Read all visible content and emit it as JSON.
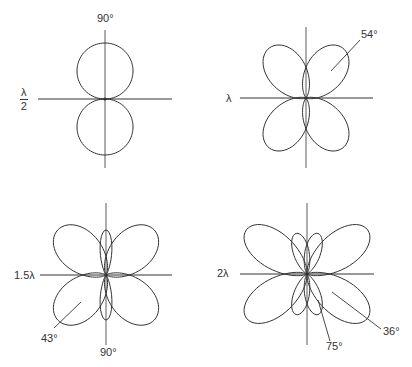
{
  "diagrams": [
    {
      "id": "half-wave",
      "length_label": "λ/2",
      "length_num": "λ",
      "length_den": "2",
      "center": [
        105,
        99
      ],
      "axis_h": [
        38,
        172
      ],
      "axis_v": [
        30,
        168
      ],
      "lobes": [
        {
          "angle": 90,
          "length": 56,
          "width": 0.95,
          "shape": "circle"
        },
        {
          "angle": 270,
          "length": 56,
          "width": 0.95,
          "shape": "circle"
        }
      ],
      "annotations": [
        {
          "text": "90°",
          "x": 97,
          "y": 19
        }
      ]
    },
    {
      "id": "full-wave",
      "length_label": "λ",
      "center": [
        306,
        98
      ],
      "axis_h": [
        240,
        373
      ],
      "axis_v": [
        27,
        168
      ],
      "lobes": [
        {
          "angle": 54,
          "length": 62,
          "width": 0.55
        },
        {
          "angle": 126,
          "length": 62,
          "width": 0.55
        },
        {
          "angle": 234,
          "length": 62,
          "width": 0.55
        },
        {
          "angle": 306,
          "length": 62,
          "width": 0.55
        }
      ],
      "annotations": [
        {
          "text": "54°",
          "x": 361,
          "y": 30
        }
      ],
      "leaders": [
        {
          "x1": 331,
          "y1": 71,
          "x2": 360,
          "y2": 40
        }
      ]
    },
    {
      "id": "one-and-half-wave",
      "length_label": "1.5λ",
      "center": [
        106,
        275
      ],
      "axis_h": [
        40,
        172
      ],
      "axis_v": [
        203,
        345
      ],
      "lobes": [
        {
          "angle": 43,
          "length": 66,
          "width": 0.55
        },
        {
          "angle": 137,
          "length": 66,
          "width": 0.55
        },
        {
          "angle": 223,
          "length": 66,
          "width": 0.55
        },
        {
          "angle": 317,
          "length": 66,
          "width": 0.55
        },
        {
          "angle": 90,
          "length": 45,
          "width": 0.22
        },
        {
          "angle": 270,
          "length": 45,
          "width": 0.22
        }
      ],
      "annotations": [
        {
          "text": "43°",
          "x": 41,
          "y": 335
        },
        {
          "text": "90°",
          "x": 101,
          "y": 349
        }
      ],
      "leaders": [
        {
          "x1": 81,
          "y1": 302,
          "x2": 54,
          "y2": 328
        }
      ]
    },
    {
      "id": "two-wave",
      "length_label": "2λ",
      "center": [
        307,
        274
      ],
      "axis_h": [
        240,
        374
      ],
      "axis_v": [
        203,
        345
      ],
      "lobes": [
        {
          "angle": 36,
          "length": 75,
          "width": 0.42
        },
        {
          "angle": 144,
          "length": 75,
          "width": 0.42
        },
        {
          "angle": 216,
          "length": 75,
          "width": 0.42
        },
        {
          "angle": 324,
          "length": 75,
          "width": 0.42
        },
        {
          "angle": 75,
          "length": 42,
          "width": 0.32
        },
        {
          "angle": 105,
          "length": 42,
          "width": 0.32
        },
        {
          "angle": 255,
          "length": 42,
          "width": 0.32
        },
        {
          "angle": 285,
          "length": 42,
          "width": 0.32
        }
      ],
      "annotations": [
        {
          "text": "75°",
          "x": 326,
          "y": 342
        },
        {
          "text": "36°",
          "x": 383,
          "y": 327
        }
      ],
      "leaders": [
        {
          "x1": 318,
          "y1": 300,
          "x2": 330,
          "y2": 341
        },
        {
          "x1": 332,
          "y1": 292,
          "x2": 381,
          "y2": 329
        }
      ]
    }
  ],
  "style": {
    "stroke": "#333333",
    "background": "#ffffff"
  }
}
